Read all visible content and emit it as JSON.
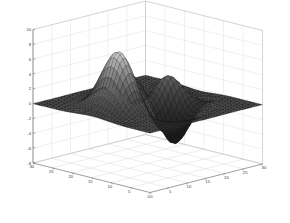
{
  "figure": {
    "title": "",
    "background_color": "#ffffff",
    "axes_color": "#6e6e6e",
    "grid_color": "#d8d8d8",
    "surface_edge_color": "#1a1a1a",
    "surface_highlight_color": "#f2f2f2",
    "surface_base_color": "#2b2b2b"
  },
  "chart_data": {
    "type": "surface",
    "title": "",
    "xlabel": "",
    "ylabel": "",
    "zlabel": "",
    "grid": true,
    "legend": null,
    "projection": "3d",
    "view": {
      "azimuth": -37.5,
      "elevation": 30
    },
    "function": "peaks",
    "mesh": {
      "nx": 41,
      "ny": 41,
      "x_count": 41,
      "y_count": 41
    },
    "xlim": [
      0,
      30
    ],
    "ylim": [
      0,
      30
    ],
    "zlim": [
      -8,
      10
    ],
    "x_ticks": [
      0,
      5,
      10,
      15,
      20,
      25,
      30
    ],
    "x_tick_labels": [
      "0",
      "5",
      "10",
      "15",
      "20",
      "25",
      "30"
    ],
    "y_ticks": [
      0,
      5,
      10,
      15,
      20,
      25,
      30
    ],
    "y_tick_labels": [
      "0",
      "5",
      "10",
      "15",
      "20",
      "25",
      "30"
    ],
    "z_ticks": [
      -8,
      -6,
      -4,
      -2,
      0,
      2,
      4,
      6,
      8,
      10
    ],
    "z_tick_labels": [
      "-8",
      "-6",
      "-4",
      "-2",
      "0",
      "2",
      "4",
      "6",
      "8",
      "10"
    ],
    "features": [
      {
        "name": "primary-peak",
        "x": 11.5,
        "y": 8.5,
        "z": 8.6
      },
      {
        "name": "secondary-peak",
        "x": 20.5,
        "y": 14.5,
        "z": 3.6
      },
      {
        "name": "tertiary-bump",
        "x": 16.5,
        "y": 17.5,
        "z": 2.1
      },
      {
        "name": "deep-valley",
        "x": 20.0,
        "y": 23.0,
        "z": -6.6
      },
      {
        "name": "shallow-dip",
        "x": 9.0,
        "y": 18.5,
        "z": -3.2
      }
    ],
    "z_values_note": "peaks(41) evaluated over x,y in [0,30]; amplitude range approx -6.6 to 8.6"
  },
  "z_axis": {
    "name": "z-axis",
    "labels": [
      "10",
      "8",
      "6",
      "4",
      "2",
      "0",
      "-2",
      "-4",
      "-6",
      "-8"
    ]
  },
  "x_axis": {
    "name": "x-axis-left-front",
    "labels": [
      "30",
      "25",
      "20",
      "15",
      "10",
      "5",
      "0"
    ]
  },
  "y_axis": {
    "name": "y-axis-right-front",
    "labels": [
      "0",
      "5",
      "10",
      "15",
      "20",
      "25",
      "30"
    ]
  }
}
